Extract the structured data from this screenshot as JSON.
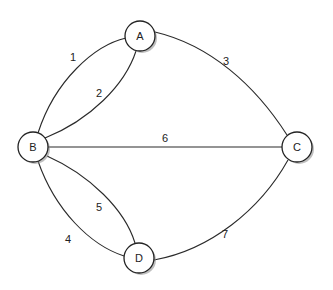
{
  "diagram": {
    "type": "multigraph",
    "nodes": [
      {
        "id": "A",
        "label": "A"
      },
      {
        "id": "B",
        "label": "B"
      },
      {
        "id": "C",
        "label": "C"
      },
      {
        "id": "D",
        "label": "D"
      }
    ],
    "edges": [
      {
        "label": "1",
        "from": "A",
        "to": "B"
      },
      {
        "label": "2",
        "from": "A",
        "to": "B"
      },
      {
        "label": "3",
        "from": "A",
        "to": "C"
      },
      {
        "label": "4",
        "from": "B",
        "to": "D"
      },
      {
        "label": "5",
        "from": "B",
        "to": "D"
      },
      {
        "label": "6",
        "from": "B",
        "to": "C"
      },
      {
        "label": "7",
        "from": "D",
        "to": "C"
      }
    ]
  }
}
